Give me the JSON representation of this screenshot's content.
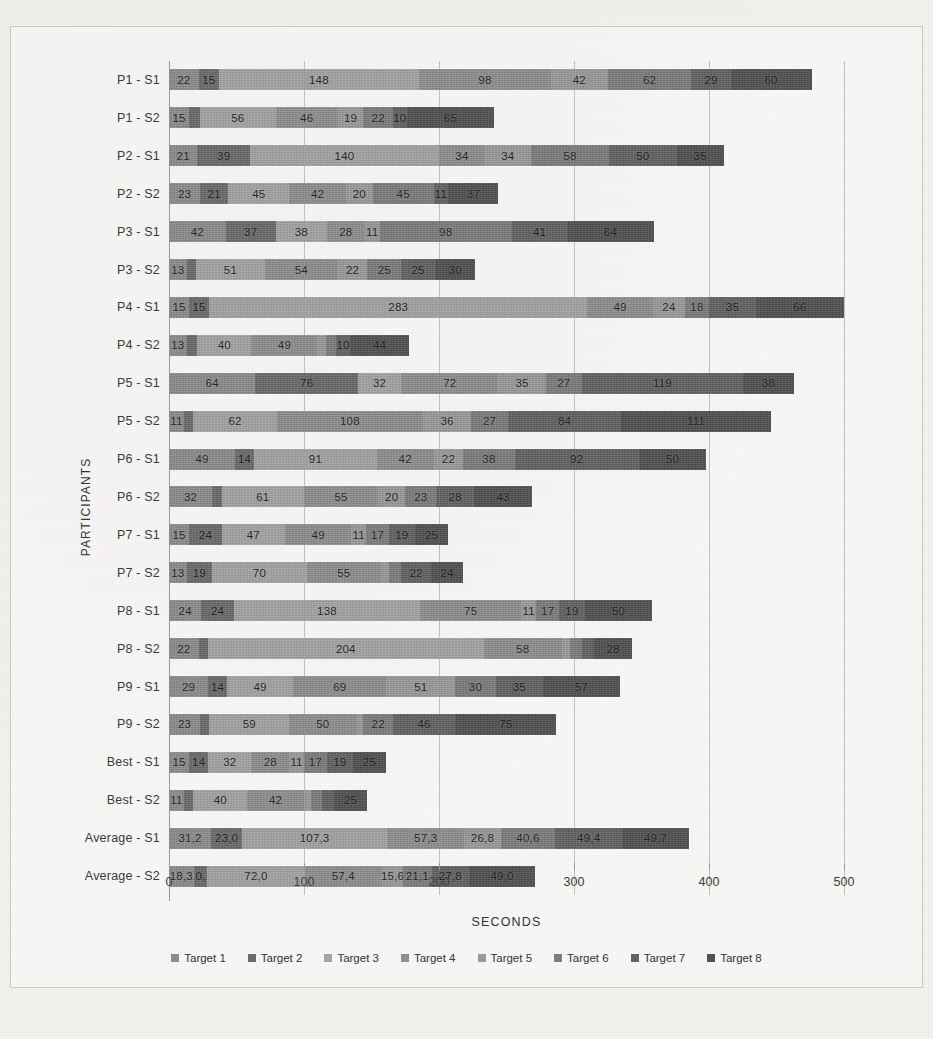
{
  "chart_data": {
    "type": "bar",
    "orientation": "horizontal",
    "stacked": true,
    "title": "",
    "xlabel": "SECONDS",
    "ylabel": "PARTICIPANTS",
    "xlim": [
      0,
      500
    ],
    "xticks": [
      0,
      100,
      200,
      300,
      400,
      500
    ],
    "xtick_labels": [
      "0",
      "100",
      "200",
      "300",
      "400",
      "500"
    ],
    "grid": true,
    "legend_position": "bottom",
    "series_names": [
      "Target 1",
      "Target 2",
      "Target 3",
      "Target 4",
      "Target 5",
      "Target 6",
      "Target 7",
      "Target 8"
    ],
    "series_colors": [
      "#8c8c8c",
      "#6b6b6b",
      "#a3a3a3",
      "#8f8f8f",
      "#9a9a9a",
      "#7d7d7d",
      "#636363",
      "#525252"
    ],
    "categories": [
      "P1 - S1",
      "P1 - S2",
      "P2 - S1",
      "P2 - S2",
      "P3 - S1",
      "P3 - S2",
      "P4 - S1",
      "P4 - S2",
      "P5 - S1",
      "P5 - S2",
      "P6 - S1",
      "P6 - S2",
      "P7 - S1",
      "P7 - S2",
      "P8 - S1",
      "P8 - S2",
      "P9 - S1",
      "P9 - S2",
      "Best - S1",
      "Best - S2",
      "Average - S1",
      "Average - S2"
    ],
    "rows": [
      {
        "category": "P1 - S1",
        "values": [
          22,
          15,
          148,
          98,
          42,
          62,
          29,
          60
        ],
        "labels": [
          "22",
          "15",
          "148",
          "98",
          "42",
          "62",
          "29",
          "60"
        ],
        "total": 476
      },
      {
        "category": "P1 - S2",
        "values": [
          15,
          8,
          56,
          46,
          19,
          22,
          10,
          65
        ],
        "labels": [
          "15",
          "8",
          "56",
          "46",
          "19",
          "22",
          "10",
          "65"
        ],
        "total": 241
      },
      {
        "category": "P2 - S1",
        "values": [
          21,
          39,
          140,
          34,
          34,
          58,
          50,
          35
        ],
        "labels": [
          "21",
          "39",
          "140",
          "34",
          "34",
          "58",
          "50",
          "35"
        ],
        "total": 411
      },
      {
        "category": "P2 - S2",
        "values": [
          23,
          21,
          45,
          42,
          20,
          45,
          11,
          37
        ],
        "labels": [
          "23",
          "21",
          "45",
          "42",
          "20",
          "45",
          "11",
          "37"
        ],
        "total": 244
      },
      {
        "category": "P3 - S1",
        "values": [
          42,
          37,
          38,
          28,
          11,
          98,
          41,
          64
        ],
        "labels": [
          "42",
          "37",
          "38",
          "28",
          "11",
          "98",
          "41",
          "64"
        ],
        "total": 359
      },
      {
        "category": "P3 - S2",
        "values": [
          13,
          7,
          51,
          54,
          22,
          25,
          25,
          30
        ],
        "labels": [
          "13",
          "7",
          "51",
          "54",
          "22",
          "25",
          "25",
          "30"
        ],
        "total": 227
      },
      {
        "category": "P4 - S1",
        "values": [
          15,
          15,
          283,
          49,
          24,
          18,
          35,
          66
        ],
        "labels": [
          "15",
          "15",
          "283",
          "49",
          "24",
          "18",
          "35",
          "66"
        ],
        "total": 505
      },
      {
        "category": "P4 - S2",
        "values": [
          13,
          8,
          40,
          49,
          6,
          8,
          10,
          44
        ],
        "labels": [
          "13",
          "8",
          "40",
          "49",
          "6",
          "8",
          "10",
          "44"
        ],
        "total": 178
      },
      {
        "category": "P5 - S1",
        "values": [
          64,
          76,
          32,
          72,
          35,
          27,
          119,
          38
        ],
        "labels": [
          "64",
          "76",
          "32",
          "72",
          "35",
          "27",
          "119",
          "38"
        ],
        "total": 463
      },
      {
        "category": "P5 - S2",
        "values": [
          11,
          7,
          62,
          108,
          36,
          27,
          84,
          111
        ],
        "labels": [
          "11",
          "7",
          "62",
          "108",
          "36",
          "27",
          "84",
          "111"
        ],
        "total": 446
      },
      {
        "category": "P6 - S1",
        "values": [
          49,
          14,
          91,
          42,
          22,
          38,
          92,
          50
        ],
        "labels": [
          "49",
          "14",
          "91",
          "42",
          "22",
          "38",
          "92",
          "50"
        ],
        "total": 398
      },
      {
        "category": "P6 - S2",
        "values": [
          32,
          7,
          61,
          55,
          20,
          23,
          28,
          43
        ],
        "labels": [
          "32",
          "7",
          "61",
          "55",
          "20",
          "23",
          "28",
          "43"
        ],
        "total": 269
      },
      {
        "category": "P7 - S1",
        "values": [
          15,
          24,
          47,
          49,
          11,
          17,
          19,
          25
        ],
        "labels": [
          "15",
          "24",
          "47",
          "49",
          "11",
          "17",
          "19",
          "25"
        ],
        "total": 207
      },
      {
        "category": "P7 - S2",
        "values": [
          13,
          19,
          70,
          55,
          6,
          9,
          22,
          24
        ],
        "labels": [
          "13",
          "19",
          "70",
          "55",
          "6",
          "9",
          "22",
          "24"
        ],
        "total": 218
      },
      {
        "category": "P8 - S1",
        "values": [
          24,
          24,
          138,
          75,
          11,
          17,
          19,
          50
        ],
        "labels": [
          "24",
          "24",
          "138",
          "75",
          "11",
          "17",
          "19",
          "50"
        ],
        "total": 358
      },
      {
        "category": "P8 - S2",
        "values": [
          22,
          7,
          204,
          58,
          6,
          9,
          9,
          28
        ],
        "labels": [
          "22",
          "7",
          "204",
          "58",
          "6",
          "9",
          "9",
          "28"
        ],
        "total": 343
      },
      {
        "category": "P9 - S1",
        "values": [
          29,
          14,
          49,
          69,
          51,
          30,
          35,
          57
        ],
        "labels": [
          "29",
          "14",
          "49",
          "69",
          "51",
          "30",
          "35",
          "57"
        ],
        "total": 334
      },
      {
        "category": "P9 - S2",
        "values": [
          23,
          7,
          59,
          50,
          5,
          22,
          46,
          75
        ],
        "labels": [
          "23",
          "7",
          "59",
          "50",
          "5",
          "22",
          "46",
          "75"
        ],
        "total": 287
      },
      {
        "category": "Best - S1",
        "values": [
          15,
          14,
          32,
          28,
          11,
          17,
          19,
          25
        ],
        "labels": [
          "15",
          "14",
          "32",
          "28",
          "11",
          "17",
          "19",
          "25"
        ],
        "total": 161
      },
      {
        "category": "Best - S2",
        "values": [
          11,
          7,
          40,
          42,
          5,
          8,
          9,
          25
        ],
        "labels": [
          "11",
          "7",
          "40",
          "42",
          "5",
          "8",
          "9",
          "25"
        ],
        "total": 147
      },
      {
        "category": "Average - S1",
        "values": [
          31.2,
          23.0,
          107.3,
          57.3,
          26.8,
          40.6,
          49.4,
          49.7
        ],
        "labels": [
          "31,2",
          "23,0",
          "107,3",
          "57,3",
          "26,8",
          "40,6",
          "49,4",
          "49,7"
        ],
        "total": 385.3
      },
      {
        "category": "Average - S2",
        "values": [
          18.3,
          10.1,
          72.0,
          57.4,
          15.6,
          21.1,
          27.8,
          49.0
        ],
        "labels": [
          "18,3",
          "10,1",
          "72,0",
          "57,4",
          "15,6",
          "21,1",
          "27,8",
          "49,0"
        ],
        "total": 271.3
      }
    ]
  },
  "background_text": {
    "lines": [
      "a screenshot of a scanned document page",
      "with a chart embedded in the text body",
      "faint bleed-through from the reverse side"
    ]
  }
}
